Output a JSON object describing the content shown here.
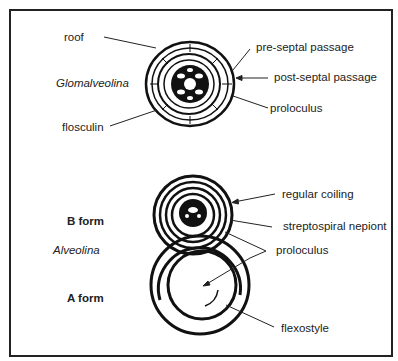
{
  "figure": {
    "top_specimen": {
      "genus": "Glomalveolina",
      "labels": {
        "roof": "roof",
        "flosculin": "flosculin",
        "pre_septal": "pre-septal passage",
        "post_septal": "post-septal passage",
        "proloculus": "proloculus"
      }
    },
    "bottom_specimens": {
      "genus": "Alveolina",
      "b_form": "B form",
      "a_form": "A form",
      "labels": {
        "regular_coiling": "regular coiling",
        "streptospiral": "streptospiral nepiont",
        "proloculus": "proloculus",
        "flexostyle": "flexostyle"
      }
    }
  }
}
